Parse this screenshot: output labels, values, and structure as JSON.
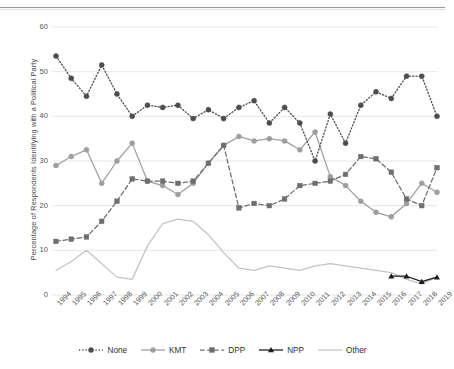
{
  "chart_data": {
    "type": "line",
    "title": "",
    "xlabel": "",
    "ylabel": "Percentage of Respondents Identifying with a Political Party",
    "ylim": [
      0,
      60
    ],
    "yticks": [
      0,
      10,
      20,
      30,
      40,
      50,
      60
    ],
    "grid": true,
    "legend_position": "bottom",
    "categories": [
      "1994",
      "1995",
      "1996",
      "1997",
      "1998",
      "1999",
      "2000",
      "2001",
      "2002",
      "2003",
      "2004",
      "2005",
      "2006",
      "2007",
      "2008",
      "2009",
      "2010",
      "2011",
      "2012",
      "2013",
      "2014",
      "2015",
      "2016",
      "2017",
      "2018",
      "2019"
    ],
    "series": [
      {
        "name": "None",
        "color": "#4d4d4d",
        "style": "dotted",
        "marker": "circle",
        "values": [
          53.5,
          48.5,
          44.5,
          51.5,
          45.0,
          40.0,
          42.5,
          42.0,
          42.5,
          39.5,
          41.5,
          39.5,
          42.0,
          43.5,
          38.5,
          42.0,
          38.5,
          30.0,
          40.5,
          34.0,
          42.5,
          45.5,
          44.0,
          49.0,
          49.0,
          40.0
        ]
      },
      {
        "name": "KMT",
        "color": "#9e9e9e",
        "style": "solid",
        "marker": "circle",
        "values": [
          29.0,
          31.0,
          32.5,
          25.0,
          30.0,
          34.0,
          25.5,
          24.5,
          22.5,
          25.0,
          29.5,
          33.5,
          35.5,
          34.5,
          35.0,
          34.5,
          32.5,
          36.5,
          26.5,
          24.5,
          21.0,
          18.5,
          17.5,
          20.5,
          25.0,
          23.0
        ]
      },
      {
        "name": "DPP",
        "color": "#6e6e6e",
        "style": "dashed",
        "marker": "square",
        "values": [
          12.0,
          12.5,
          13.0,
          16.5,
          21.0,
          26.0,
          25.5,
          25.5,
          25.0,
          25.5,
          29.5,
          33.5,
          19.5,
          20.5,
          20.0,
          21.5,
          24.5,
          25.0,
          25.5,
          27.0,
          31.0,
          30.5,
          27.5,
          21.5,
          20.0,
          28.5
        ]
      },
      {
        "name": "NPP",
        "color": "#1a1a1a",
        "style": "solid",
        "marker": "triangle",
        "values": [
          null,
          null,
          null,
          null,
          null,
          null,
          null,
          null,
          null,
          null,
          null,
          null,
          null,
          null,
          null,
          null,
          null,
          null,
          null,
          null,
          null,
          null,
          4.2,
          4.2,
          3.0,
          4.0
        ]
      },
      {
        "name": "Other",
        "color": "#c4c4c4",
        "style": "solid",
        "marker": "none",
        "values": [
          5.5,
          7.5,
          10.0,
          7.0,
          4.0,
          3.5,
          11.0,
          16.0,
          17.0,
          16.5,
          13.5,
          9.5,
          6.0,
          5.5,
          6.5,
          6.0,
          5.5,
          6.5,
          7.0,
          6.5,
          6.0,
          5.5,
          5.0,
          3.5,
          2.5,
          4.0
        ]
      }
    ]
  },
  "legend": {
    "items": [
      {
        "label": "None"
      },
      {
        "label": "KMT"
      },
      {
        "label": "DPP"
      },
      {
        "label": "NPP"
      },
      {
        "label": "Other"
      }
    ]
  }
}
